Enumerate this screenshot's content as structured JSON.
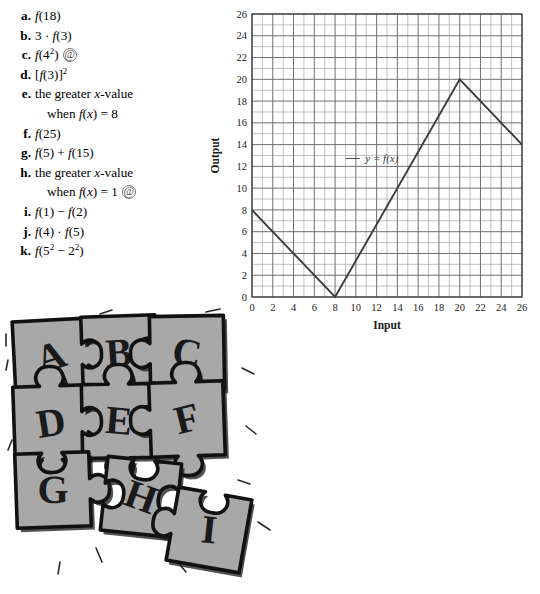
{
  "exercises": {
    "items": [
      {
        "label": "a.",
        "expr": "f(18)",
        "at": false
      },
      {
        "label": "b.",
        "expr": "3 · f(3)",
        "at": false
      },
      {
        "label": "c.",
        "expr": "f(4²)",
        "at": true
      },
      {
        "label": "d.",
        "expr": "[f(3)]²",
        "at": false
      },
      {
        "label": "e.",
        "expr": "the greater x-value",
        "cont": "when f(x) = 8",
        "at": false
      },
      {
        "label": "f.",
        "expr": "f(25)",
        "at": false
      },
      {
        "label": "g.",
        "expr": "f(5) + f(15)",
        "at": false
      },
      {
        "label": "h.",
        "expr": "the greater x-value",
        "cont": "when f(x) = 1",
        "at": true
      },
      {
        "label": "i.",
        "expr": "f(1) − f(2)",
        "at": false
      },
      {
        "label": "j.",
        "expr": "f(4) · f(5)",
        "at": false
      },
      {
        "label": "k.",
        "expr": "f(5² − 2²)",
        "at": false
      }
    ],
    "at_symbol": "@"
  },
  "chart_data": {
    "type": "line",
    "title": "",
    "xlabel": "Input",
    "ylabel": "Output",
    "xlim": [
      0,
      26
    ],
    "ylim": [
      0,
      26
    ],
    "xticks": [
      0,
      2,
      4,
      6,
      8,
      10,
      12,
      14,
      16,
      18,
      20,
      22,
      24,
      26
    ],
    "yticks": [
      0,
      2,
      4,
      6,
      8,
      10,
      12,
      14,
      16,
      18,
      20,
      22,
      24,
      26
    ],
    "minor_tick_step": 1,
    "grid": true,
    "legend_position": "inline",
    "series": [
      {
        "name": "y = f(x)",
        "points": [
          [
            0,
            8
          ],
          [
            8,
            0
          ],
          [
            20,
            20
          ],
          [
            26,
            14
          ]
        ],
        "color": "#3c3c3c"
      }
    ],
    "annotations": [
      {
        "text": "y = f(x)",
        "x": 12.5,
        "y": 12.4
      }
    ]
  },
  "puzzle": {
    "caption": "",
    "pieces": [
      {
        "letter": "A",
        "row": 0,
        "col": 0
      },
      {
        "letter": "B",
        "row": 0,
        "col": 1
      },
      {
        "letter": "C",
        "row": 0,
        "col": 2
      },
      {
        "letter": "D",
        "row": 1,
        "col": 0
      },
      {
        "letter": "E",
        "row": 1,
        "col": 1
      },
      {
        "letter": "F",
        "row": 1,
        "col": 2
      },
      {
        "letter": "G",
        "row": 2,
        "col": 0
      },
      {
        "letter": "H",
        "row": 2,
        "col": 1
      },
      {
        "letter": "I",
        "row": 2,
        "col": 2
      }
    ],
    "piece_fill": "#a8a8a8",
    "piece_stroke": "#111111",
    "letter_fill": "#1a1a1a"
  }
}
